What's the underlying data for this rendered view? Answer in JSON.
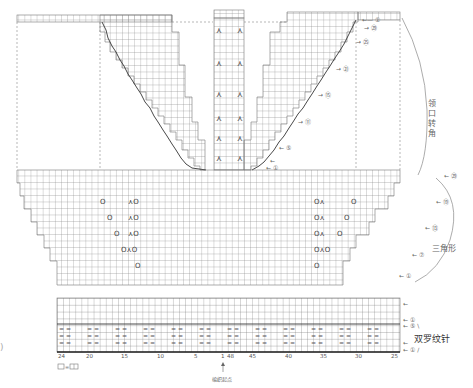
{
  "diagram": {
    "grid": {
      "cell_w": 6.1,
      "cell_h": 6.5,
      "line_color": "#8a8a8a",
      "bold_line_color": "#333333"
    },
    "side_labels": {
      "neck_shaping": "领口转角",
      "triangle_section": "三角形",
      "double_rib": "双罗纹针"
    },
    "row_markers_right_top": [
      "①",
      "㉙",
      "㉕",
      "㉑",
      "⑮",
      "⑪",
      "⑤",
      "③",
      "①"
    ],
    "row_markers_right_body": [
      "㉙",
      "⑲",
      "⑬",
      "⑦",
      "①"
    ],
    "row_markers_rib": [
      "←",
      "①",
      "⑤",
      "←",
      "①"
    ],
    "x_axis_ticks": [
      {
        "label": "24",
        "x": 62
      },
      {
        "label": "20",
        "x": 89
      },
      {
        "label": "15",
        "x": 124
      },
      {
        "label": "10",
        "x": 160
      },
      {
        "label": "5",
        "x": 195
      },
      {
        "label": "1",
        "x": 222
      },
      {
        "label": "48",
        "x": 231
      },
      {
        "label": "45",
        "x": 251
      },
      {
        "label": "40",
        "x": 288
      },
      {
        "label": "35",
        "x": 322
      },
      {
        "label": "30",
        "x": 357
      },
      {
        "label": "25",
        "x": 392
      }
    ],
    "start_label": "编织起点",
    "legend": {
      "symbol": "□",
      "equals": "=",
      "meaning": "□□"
    },
    "symbols": {
      "yarn_over": "O",
      "k2tog": "⋏",
      "purl": "—"
    }
  }
}
